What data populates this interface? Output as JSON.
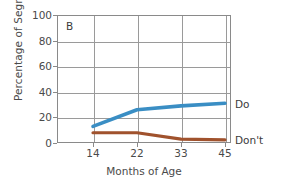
{
  "figure": {
    "panel_letter": "B"
  },
  "chart_data": {
    "type": "line",
    "title": "",
    "panel": "B",
    "xlabel": "Months of Age",
    "ylabel": "Percentage of Segments",
    "categories": [
      "14",
      "22",
      "33",
      "45"
    ],
    "x_tick_labels": [
      "14",
      "22",
      "33",
      "45"
    ],
    "y_tick_labels": [
      "0",
      "20",
      "40",
      "60",
      "80",
      "100"
    ],
    "ylim": [
      0,
      100
    ],
    "y_ticks": [
      0,
      20,
      40,
      60,
      80,
      100
    ],
    "grid": "horizontal-and-vertical",
    "legend_position": "right-of-line-ends",
    "series": [
      {
        "name": "Do",
        "label": "Do",
        "color": "#3a8ec4",
        "values": [
          13,
          26,
          29,
          31
        ]
      },
      {
        "name": "Don't",
        "label": "Don't",
        "color": "#a0522d",
        "values": [
          8,
          8,
          3,
          2.5
        ]
      }
    ]
  }
}
